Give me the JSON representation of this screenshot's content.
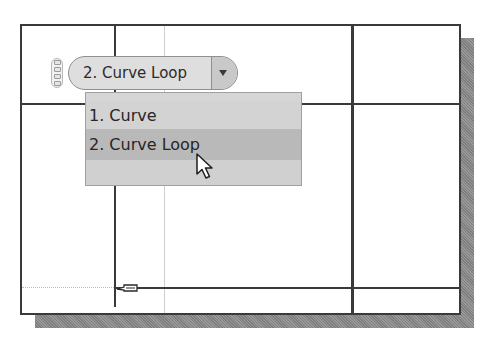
{
  "viewport": {
    "background": "#ffffff",
    "frame_color": "#3a3a3a",
    "shadow_color": "#8c8c8c"
  },
  "selection_filter": {
    "handle_icon": "drag-handle-icon",
    "current_value": "2. Curve Loop",
    "dropdown_icon": "triangle-down-icon",
    "options": [
      {
        "label": "1. Curve",
        "selected": false
      },
      {
        "label": "2. Curve Loop",
        "selected": true
      },
      {
        "label": "",
        "selected": false
      }
    ]
  },
  "cursor": {
    "icon": "arrow-pointer-icon"
  },
  "sketch": {
    "snap_icon": "pencil-snap-icon"
  }
}
